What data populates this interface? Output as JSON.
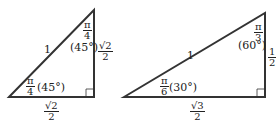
{
  "triangles": [
    {
      "name": "45-45-90",
      "hypotenuse": "1",
      "top_angle": {
        "num": "π",
        "den": "4",
        "deg": "(45°)"
      },
      "bottom_angle": {
        "num": "π",
        "den": "4",
        "deg": "(45°)"
      },
      "vertical_side": {
        "num": "√2",
        "den": "2"
      },
      "horizontal_side": {
        "num": "√2",
        "den": "2"
      }
    },
    {
      "name": "30-60-90",
      "hypotenuse": "1",
      "top_angle": {
        "num": "π",
        "den": "3",
        "deg": "(60°)"
      },
      "bottom_angle": {
        "num": "π",
        "den": "6",
        "deg": "(30°)"
      },
      "vertical_side": {
        "num": "1",
        "den": "2"
      },
      "horizontal_side": {
        "num": "√3",
        "den": "2"
      }
    }
  ]
}
